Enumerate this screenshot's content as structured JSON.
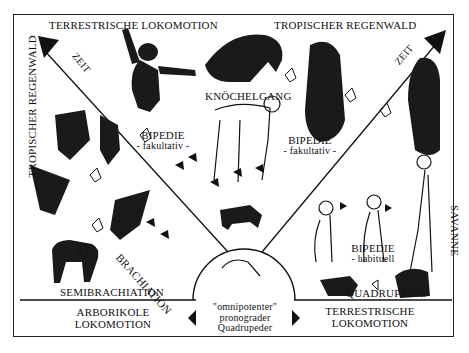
{
  "diagram": {
    "top_left_title": "TERRESTRISCHE LOKOMOTION",
    "top_right_title": "TROPISCHER REGENWALD",
    "left_side_title": "TROPISCHER REGENWALD",
    "right_side_title": "SAVANNE",
    "time_left": "ZEIT",
    "time_right": "ZEIT",
    "stages": {
      "knuckle_walking": "KNÖCHELGANG",
      "bipedal_facultative_left": {
        "line1": "BIPEDIE",
        "line2": "- fakultativ -"
      },
      "bipedal_facultative_right": {
        "line1": "BIPEDIE",
        "line2": "- fakultativ -"
      },
      "brachiation": "BRACHIATION",
      "semibrachiation": "SEMIBRACHIATION",
      "bipedal_habitual": {
        "line1": "BIPEDIE",
        "line2": "- habituell"
      },
      "quadrupedal": "QUADRUPEDIE"
    },
    "bottom_left": {
      "line1": "ARBORIKOLE",
      "line2": "LOKOMOTION"
    },
    "bottom_right": {
      "line1": "TERRESTRISCHE",
      "line2": "LOKOMOTION"
    },
    "center": {
      "line1": "\"omnipotenter\"",
      "line2": "pronograder",
      "line3": "Quadrupeder"
    },
    "colors": {
      "ink": "#111111",
      "background": "#ffffff"
    }
  }
}
